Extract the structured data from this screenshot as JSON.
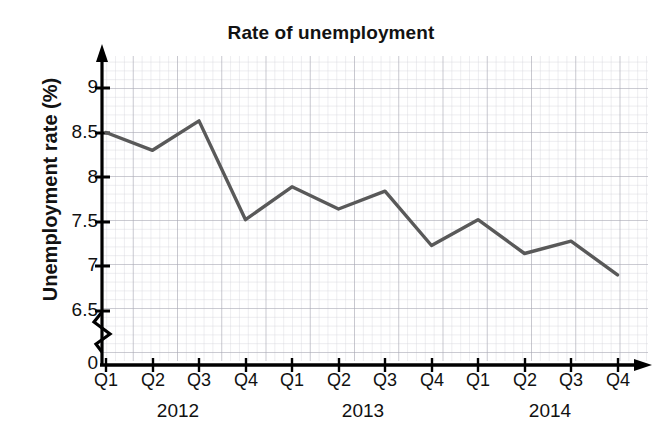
{
  "chart_data": {
    "type": "line",
    "title": "Rate of unemployment",
    "xlabel": "",
    "ylabel": "Unemployment rate (%)",
    "categories": [
      "Q1",
      "Q2",
      "Q3",
      "Q4",
      "Q1",
      "Q2",
      "Q3",
      "Q4",
      "Q1",
      "Q2",
      "Q3",
      "Q4"
    ],
    "groups": [
      {
        "label": "2012",
        "quarters": [
          "Q1",
          "Q2",
          "Q3",
          "Q4"
        ]
      },
      {
        "label": "2013",
        "quarters": [
          "Q1",
          "Q2",
          "Q3",
          "Q4"
        ]
      },
      {
        "label": "2014",
        "quarters": [
          "Q1",
          "Q2",
          "Q3",
          "Q4"
        ]
      }
    ],
    "values": [
      8.5,
      8.3,
      8.63,
      7.52,
      7.89,
      7.64,
      7.84,
      7.23,
      7.52,
      7.14,
      7.28,
      6.9
    ],
    "points": [
      {
        "period": "Q1 2012",
        "value": 8.5
      },
      {
        "period": "Q2 2012",
        "value": 8.3
      },
      {
        "period": "Q3 2012",
        "value": 8.63
      },
      {
        "period": "Q4 2012",
        "value": 7.52
      },
      {
        "period": "Q1 2013",
        "value": 7.89
      },
      {
        "period": "Q2 2013",
        "value": 7.64
      },
      {
        "period": "Q3 2013",
        "value": 7.84
      },
      {
        "period": "Q4 2013",
        "value": 7.23
      },
      {
        "period": "Q1 2014",
        "value": 7.52
      },
      {
        "period": "Q2 2014",
        "value": 7.14
      },
      {
        "period": "Q3 2014",
        "value": 7.28
      },
      {
        "period": "Q4 2014",
        "value": 6.9
      }
    ],
    "ytick_labels": [
      "9",
      "8.5",
      "8",
      "7.5",
      "7",
      "6.5",
      "0"
    ],
    "ylim": [
      6.5,
      9.25
    ],
    "y_axis_break": true,
    "grid": true,
    "legend": "none",
    "line_color": "#595959",
    "axis_color": "#000000",
    "grid_color": "#c9c9d2"
  }
}
